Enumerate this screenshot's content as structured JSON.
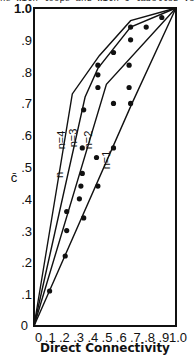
{
  "caption": "hs with loops and with 6 labelled vertices",
  "chart_data": {
    "type": "line",
    "title": "",
    "xlabel": "Direct Connectivity",
    "ylabel": "c̄",
    "xlim": [
      0,
      1.0
    ],
    "ylim": [
      0,
      1.0
    ],
    "x_ticks": [
      "0",
      ".1",
      ".2",
      ".3",
      ".4",
      ".5",
      ".6",
      ".7",
      ".8",
      ".9",
      "1.0"
    ],
    "y_ticks": [
      "0",
      ".1",
      ".2",
      ".3",
      ".4",
      ".5",
      ".6",
      ".7",
      ".8",
      ".9",
      "1.0"
    ],
    "grid": false,
    "legend": "inline labels",
    "series": [
      {
        "name": "n=1",
        "x": [
          0,
          0.69,
          1.0
        ],
        "y": [
          0,
          0.7,
          1.0
        ]
      },
      {
        "name": "n=2",
        "x": [
          0,
          0.51,
          1.0
        ],
        "y": [
          0,
          0.76,
          1.0
        ]
      },
      {
        "name": "n=3",
        "x": [
          0,
          0.36,
          0.45,
          0.68,
          1.0
        ],
        "y": [
          0,
          0.72,
          0.81,
          0.94,
          1.0
        ]
      },
      {
        "name": "n=4",
        "x": [
          0,
          0.27,
          0.46,
          0.68,
          1.0
        ],
        "y": [
          0,
          0.73,
          0.85,
          0.96,
          1.0
        ]
      }
    ],
    "points": {
      "x": [
        0.11,
        0.22,
        0.23,
        0.35,
        0.23,
        0.32,
        0.33,
        0.45,
        0.34,
        0.44,
        0.34,
        0.56,
        0.35,
        0.56,
        0.68,
        0.45,
        0.45,
        0.45,
        0.67,
        0.67,
        0.56,
        0.68,
        0.68,
        0.79,
        0.9
      ],
      "y": [
        0.11,
        0.22,
        0.3,
        0.34,
        0.36,
        0.4,
        0.44,
        0.44,
        0.48,
        0.53,
        0.56,
        0.56,
        0.68,
        0.7,
        0.7,
        0.75,
        0.79,
        0.82,
        0.75,
        0.82,
        0.86,
        0.9,
        0.94,
        0.94,
        0.97
      ]
    },
    "annotations": [
      "n",
      "n=4",
      "n=3",
      "n=2",
      "n=1"
    ]
  }
}
